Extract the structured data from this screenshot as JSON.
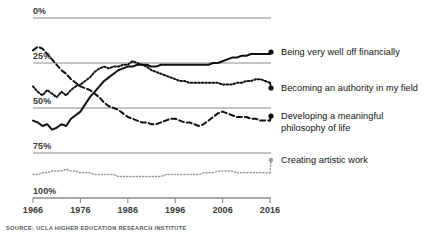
{
  "chart_data": {
    "type": "line",
    "title": "",
    "subtitle": "",
    "xlabel": "",
    "ylabel": "",
    "xlim": [
      1966,
      2016
    ],
    "ylim": [
      0,
      100
    ],
    "grid": true,
    "legend_position": "right",
    "source": "SOURCE: UCLA HIGHER EDUCATION RESEARCH INSTITUTE",
    "y_ticks": [
      "0%",
      "25%",
      "50%",
      "75%",
      "100%"
    ],
    "y_tick_values": [
      0,
      25,
      50,
      75,
      100
    ],
    "x_ticks": [
      "1966",
      "1976",
      "1986",
      "1996",
      "2006",
      "2016"
    ],
    "x_tick_values": [
      1966,
      1976,
      1986,
      1996,
      2006,
      2016
    ],
    "x": [
      1966,
      1967,
      1968,
      1969,
      1970,
      1971,
      1972,
      1973,
      1974,
      1975,
      1976,
      1977,
      1978,
      1979,
      1980,
      1981,
      1982,
      1983,
      1984,
      1985,
      1986,
      1987,
      1988,
      1989,
      1990,
      1991,
      1992,
      1993,
      1994,
      1995,
      1996,
      1997,
      1998,
      1999,
      2000,
      2001,
      2002,
      2003,
      2004,
      2005,
      2006,
      2007,
      2008,
      2009,
      2010,
      2011,
      2012,
      2013,
      2014,
      2015,
      2016
    ],
    "series": [
      {
        "name": "Being very well off financially",
        "style": "solid",
        "color": "#111111",
        "values": [
          43,
          42,
          40,
          41,
          38,
          39,
          41,
          40,
          44,
          46,
          48,
          52,
          56,
          59,
          62,
          65,
          67,
          69,
          71,
          72,
          73,
          73,
          74,
          74,
          74,
          73,
          73,
          74,
          74,
          74,
          74,
          74,
          74,
          74,
          74,
          74,
          74,
          74,
          75,
          75,
          76,
          77,
          78,
          78,
          79,
          79,
          80,
          80,
          80,
          80,
          80
        ]
      },
      {
        "name": "Becoming an authority in my field",
        "style": "dotted",
        "color": "#111111",
        "values": [
          62,
          59,
          57,
          60,
          58,
          56,
          59,
          57,
          60,
          62,
          63,
          65,
          67,
          70,
          72,
          73,
          72,
          73,
          73,
          74,
          74,
          76,
          75,
          74,
          73,
          71,
          70,
          69,
          68,
          67,
          66,
          65,
          65,
          64,
          64,
          64,
          64,
          64,
          64,
          64,
          63,
          63,
          63,
          64,
          64,
          65,
          65,
          66,
          66,
          65,
          64
        ]
      },
      {
        "name": "Developing a meaningful\nphilosophy of life",
        "style": "dashed",
        "color": "#111111",
        "values": [
          82,
          84,
          83,
          80,
          77,
          74,
          71,
          69,
          66,
          64,
          62,
          61,
          60,
          58,
          56,
          53,
          51,
          50,
          49,
          47,
          45,
          44,
          43,
          42,
          42,
          41,
          41,
          42,
          43,
          44,
          44,
          43,
          42,
          42,
          41,
          40,
          41,
          43,
          45,
          47,
          48,
          47,
          46,
          45,
          45,
          45,
          44,
          44,
          43,
          43,
          43
        ]
      },
      {
        "name": "Creating artistic work",
        "style": "fine-dotted",
        "color": "#9a9a9a",
        "values": [
          13,
          13,
          14,
          14,
          15,
          15,
          15,
          16,
          15,
          15,
          14,
          14,
          14,
          13,
          13,
          13,
          13,
          13,
          12,
          12,
          12,
          12,
          12,
          12,
          12,
          12,
          12,
          12,
          13,
          13,
          13,
          13,
          13,
          13,
          13,
          13,
          14,
          14,
          14,
          15,
          15,
          15,
          15,
          14,
          14,
          14,
          14,
          14,
          14,
          14,
          14
        ]
      }
    ]
  },
  "legend": {
    "items": [
      {
        "label": "Being very well off financially",
        "marker": "dot"
      },
      {
        "label": "Becoming an authority in my field",
        "marker": "dot"
      },
      {
        "label": "Developing a meaningful\nphilosophy of life",
        "marker": "dot"
      },
      {
        "label": "Creating artistic work",
        "marker": "dot"
      }
    ]
  },
  "axis": {
    "y_labels": [
      "100%",
      "75%",
      "50%",
      "25%",
      "0%"
    ],
    "x_labels": [
      "1966",
      "1976",
      "1986",
      "1996",
      "2006",
      "2016"
    ]
  },
  "footer": {
    "source": "SOURCE: UCLA HIGHER EDUCATION RESEARCH INSTITUTE"
  },
  "colors": {
    "ink": "#111111",
    "grid": "#8c8c8c",
    "muted": "#9a9a9a",
    "background": "#ffffff"
  }
}
